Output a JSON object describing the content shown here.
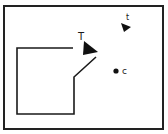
{
  "diagram": {
    "frame": {
      "x": 4,
      "y": 6,
      "width": 159,
      "height": 123,
      "stroke": "#222222"
    },
    "path": {
      "points": [
        [
          73,
          48
        ],
        [
          17,
          48
        ],
        [
          17,
          114
        ],
        [
          74,
          114
        ],
        [
          74,
          77
        ],
        [
          96,
          57
        ]
      ],
      "stroke": "#1a1a1a"
    },
    "markers": [
      {
        "id": "T",
        "label": "T",
        "shape": "triangle-large",
        "points": [
          [
            84,
            41
          ],
          [
            98,
            52
          ],
          [
            83,
            55
          ]
        ],
        "label_x": 78,
        "label_y": 40,
        "label_size": 10
      },
      {
        "id": "t",
        "label": "t",
        "shape": "triangle-small",
        "points": [
          [
            121,
            23
          ],
          [
            131,
            27
          ],
          [
            124,
            32
          ]
        ],
        "label_x": 126,
        "label_y": 20,
        "label_size": 8
      }
    ],
    "point": {
      "id": "c",
      "label": "c",
      "cx": 116,
      "cy": 71,
      "r": 2.6,
      "label_x": 122,
      "label_y": 74,
      "label_size": 9
    }
  }
}
